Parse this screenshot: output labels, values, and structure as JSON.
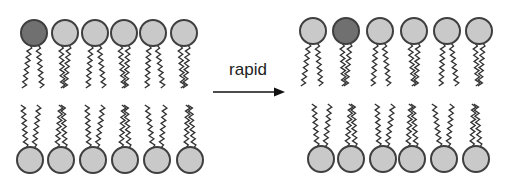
{
  "arrow": {
    "label": "rapid"
  },
  "colors": {
    "marked_head": "#707070",
    "normal_head": "#c9c9c9",
    "outline": "#3f3f3f",
    "tail": "#333333",
    "arrow": "#111111"
  },
  "before": {
    "outer_leaflet": [
      {
        "marked": true
      },
      {
        "marked": false
      },
      {
        "marked": false
      },
      {
        "marked": false
      },
      {
        "marked": false
      },
      {
        "marked": false
      }
    ],
    "inner_leaflet": [
      {
        "marked": false
      },
      {
        "marked": false
      },
      {
        "marked": false
      },
      {
        "marked": false
      },
      {
        "marked": false
      },
      {
        "marked": false
      }
    ]
  },
  "after": {
    "outer_leaflet": [
      {
        "marked": false
      },
      {
        "marked": true
      },
      {
        "marked": false
      },
      {
        "marked": false
      },
      {
        "marked": false
      },
      {
        "marked": false
      }
    ],
    "inner_leaflet": [
      {
        "marked": false
      },
      {
        "marked": false
      },
      {
        "marked": false
      },
      {
        "marked": false
      },
      {
        "marked": false
      },
      {
        "marked": false
      }
    ]
  }
}
